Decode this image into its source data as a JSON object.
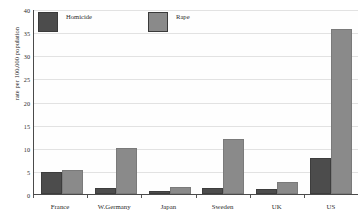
{
  "chart_data": {
    "type": "bar",
    "title": "",
    "xlabel": "",
    "ylabel": "rate per 100,000 population",
    "ylim": [
      0,
      40
    ],
    "yticks": [
      40,
      35,
      30,
      25,
      20,
      15,
      10,
      5,
      0
    ],
    "ytick_labels": [
      "40",
      "35",
      "30",
      "25",
      "20",
      "15",
      "10",
      "5",
      "0"
    ],
    "grid": true,
    "legend_position": "top-left",
    "categories": [
      "France",
      "W.Germany",
      "Japan",
      "Sweden",
      "UK",
      "US"
    ],
    "series": [
      {
        "name": "Homicide",
        "color": "#4c4c4c",
        "values": [
          4.7,
          1.4,
          0.7,
          1.3,
          1.1,
          7.8
        ]
      },
      {
        "name": "Rape",
        "color": "#8a8a8a",
        "values": [
          5.3,
          9.9,
          1.6,
          11.8,
          2.7,
          35.6
        ]
      }
    ]
  },
  "legend": {
    "entries": [
      {
        "label": "Homicide"
      },
      {
        "label": "Rape"
      }
    ]
  }
}
